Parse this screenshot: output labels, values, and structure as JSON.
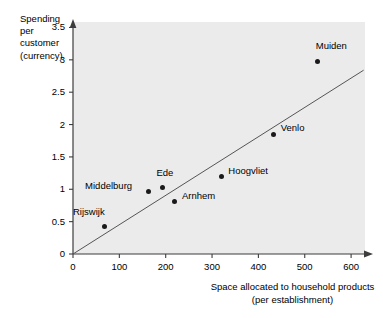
{
  "chart_data": {
    "type": "scatter",
    "title": "",
    "xlabel": "Space allocated to household products (per establishment)",
    "ylabel": "Spending per customer (currency)",
    "xlim": [
      0,
      630
    ],
    "ylim": [
      0,
      3.6
    ],
    "xticks": [
      0,
      100,
      200,
      300,
      400,
      500,
      600
    ],
    "xticklabels": [
      "0",
      "100",
      "200",
      "300",
      "400",
      "500",
      "600"
    ],
    "yticks": [
      0,
      0.5,
      1,
      1.5,
      2,
      2.5,
      3,
      3.5
    ],
    "yticklabels": [
      "0",
      "0.5",
      "1",
      "1.5",
      "2",
      "2.5",
      "3",
      "3.5"
    ],
    "grid": false,
    "legend": "none",
    "panel_color": "#ebebeb",
    "marker_color": "#1a1a1a",
    "trendline_color": "#555555",
    "points": [
      {
        "label": "Rijswijk",
        "x": 69,
        "y": 0.42,
        "label_dx": -32,
        "label_dy": -15
      },
      {
        "label": "Middelburg",
        "x": 162,
        "y": 0.96,
        "label_dx": -63,
        "label_dy": -6
      },
      {
        "label": "Ede",
        "x": 193,
        "y": 1.02,
        "label_dx": -6,
        "label_dy": -15
      },
      {
        "label": "Arnhem",
        "x": 220,
        "y": 0.81,
        "label_dx": 7,
        "label_dy": -6
      },
      {
        "label": "Hoogvliet",
        "x": 320,
        "y": 1.19,
        "label_dx": 7,
        "label_dy": -6
      },
      {
        "label": "Venlo",
        "x": 433,
        "y": 1.85,
        "label_dx": 7,
        "label_dy": -6
      },
      {
        "label": "Muiden",
        "x": 528,
        "y": 2.97,
        "label_dx": -2,
        "label_dy": -16
      }
    ],
    "trendline": {
      "x0": 0,
      "y0": 0,
      "x1": 627,
      "y1": 2.84
    }
  }
}
